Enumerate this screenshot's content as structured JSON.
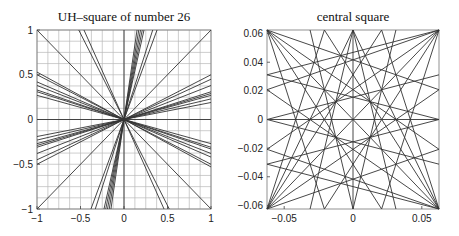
{
  "chart_data": [
    {
      "type": "line",
      "title": "UH–square of number 26",
      "xlabel": "",
      "ylabel": "",
      "xlim": [
        -1,
        1
      ],
      "ylim": [
        -1,
        1
      ],
      "grid": true,
      "grid_step": 0.125,
      "xticks": [
        -1,
        -0.5,
        0,
        0.5,
        1
      ],
      "xtick_labels": [
        "−1",
        "−0.5",
        "0",
        "0.5",
        "1"
      ],
      "yticks": [
        -1,
        -0.5,
        0,
        0.5,
        1
      ],
      "ytick_labels": [
        "−1",
        "−0.5",
        "0",
        "0.5",
        "1"
      ],
      "description": "Straight lines passing (approximately) through the origin at various slopes, clipped to the square [-1,1]x[-1,1]",
      "segments": [
        [
          [
            -1,
            1
          ],
          [
            1,
            -1
          ]
        ],
        [
          [
            -1,
            -1
          ],
          [
            1,
            1
          ]
        ],
        [
          [
            -1,
            0
          ],
          [
            1,
            0
          ]
        ],
        [
          [
            0,
            -1
          ],
          [
            0,
            1
          ]
        ],
        [
          [
            -1,
            0.53
          ],
          [
            1,
            -0.53
          ]
        ],
        [
          [
            -1,
            0.5
          ],
          [
            1,
            -0.5
          ]
        ],
        [
          [
            -1,
            0.42
          ],
          [
            1,
            -0.42
          ]
        ],
        [
          [
            -1,
            0.38
          ],
          [
            1,
            -0.38
          ]
        ],
        [
          [
            -1,
            0.33
          ],
          [
            1,
            -0.33
          ]
        ],
        [
          [
            -1,
            0.31
          ],
          [
            1,
            -0.31
          ]
        ],
        [
          [
            -1,
            0.27
          ],
          [
            1,
            -0.27
          ]
        ],
        [
          [
            -1,
            -0.19
          ],
          [
            1,
            0.19
          ]
        ],
        [
          [
            -1,
            -0.23
          ],
          [
            1,
            0.23
          ]
        ],
        [
          [
            -1,
            -0.27
          ],
          [
            1,
            0.27
          ]
        ],
        [
          [
            -1,
            -0.29
          ],
          [
            1,
            0.29
          ]
        ],
        [
          [
            -1,
            -0.31
          ],
          [
            1,
            0.31
          ]
        ],
        [
          [
            -1,
            -0.38
          ],
          [
            1,
            0.38
          ]
        ],
        [
          [
            -1,
            -0.45
          ],
          [
            1,
            0.45
          ]
        ],
        [
          [
            -1,
            -0.5
          ],
          [
            1,
            0.5
          ]
        ],
        [
          [
            -0.52,
            1
          ],
          [
            0.52,
            -1
          ]
        ],
        [
          [
            -0.46,
            1
          ],
          [
            0.46,
            -1
          ]
        ],
        [
          [
            0.15,
            1
          ],
          [
            -0.15,
            -1
          ]
        ],
        [
          [
            0.17,
            1
          ],
          [
            -0.17,
            -1
          ]
        ],
        [
          [
            0.19,
            1
          ],
          [
            -0.19,
            -1
          ]
        ],
        [
          [
            0.21,
            1
          ],
          [
            -0.21,
            -1
          ]
        ],
        [
          [
            0.23,
            1
          ],
          [
            -0.23,
            -1
          ]
        ],
        [
          [
            0.33,
            1
          ],
          [
            -0.33,
            -1
          ]
        ],
        [
          [
            0.38,
            1
          ],
          [
            -0.38,
            -1
          ]
        ]
      ]
    },
    {
      "type": "line",
      "title": "central square",
      "xlabel": "",
      "ylabel": "",
      "xlim": [
        -0.0625,
        0.0625
      ],
      "ylim": [
        -0.0625,
        0.0625
      ],
      "grid": false,
      "xticks": [
        -0.05,
        0,
        0.05
      ],
      "xtick_labels": [
        "−0.05",
        "0",
        "0.05"
      ],
      "yticks": [
        -0.06,
        -0.04,
        -0.02,
        0,
        0.02,
        0.04,
        0.06
      ],
      "ytick_labels": [
        "−0.06",
        "−0.04",
        "−0.02",
        "0",
        "0.02",
        "0.04",
        "0.06"
      ],
      "description": "Zoom on the central square showing lines fanning from corners and edge midpoints",
      "segments": [
        [
          [
            -0.0625,
            0.0625
          ],
          [
            0.0625,
            -0.0625
          ]
        ],
        [
          [
            -0.0625,
            -0.0625
          ],
          [
            0.0625,
            0.0625
          ]
        ],
        [
          [
            -0.0625,
            0
          ],
          [
            0.0625,
            0
          ]
        ],
        [
          [
            0,
            -0.0625
          ],
          [
            0,
            0.0625
          ]
        ],
        [
          [
            -0.0625,
            0.0625
          ],
          [
            0.0625,
            0.0208
          ]
        ],
        [
          [
            -0.0625,
            0.0625
          ],
          [
            0.0625,
            -0.0208
          ]
        ],
        [
          [
            -0.0625,
            0.0625
          ],
          [
            0.0208,
            -0.0625
          ]
        ],
        [
          [
            -0.0625,
            0.0625
          ],
          [
            -0.0208,
            -0.0625
          ]
        ],
        [
          [
            0.0625,
            0.0625
          ],
          [
            -0.0625,
            0.0208
          ]
        ],
        [
          [
            0.0625,
            0.0625
          ],
          [
            -0.0625,
            -0.0208
          ]
        ],
        [
          [
            0.0625,
            0.0625
          ],
          [
            -0.0208,
            -0.0625
          ]
        ],
        [
          [
            0.0625,
            0.0625
          ],
          [
            0.0208,
            -0.0625
          ]
        ],
        [
          [
            -0.0625,
            -0.0625
          ],
          [
            0.0625,
            0.0208
          ]
        ],
        [
          [
            -0.0625,
            -0.0625
          ],
          [
            0.0625,
            -0.0208
          ]
        ],
        [
          [
            -0.0625,
            -0.0625
          ],
          [
            0.0208,
            0.0625
          ]
        ],
        [
          [
            -0.0625,
            -0.0625
          ],
          [
            -0.0208,
            0.0625
          ]
        ],
        [
          [
            0.0625,
            -0.0625
          ],
          [
            -0.0625,
            0.0208
          ]
        ],
        [
          [
            0.0625,
            -0.0625
          ],
          [
            -0.0625,
            -0.0208
          ]
        ],
        [
          [
            0.0625,
            -0.0625
          ],
          [
            -0.0208,
            0.0625
          ]
        ],
        [
          [
            0.0625,
            -0.0625
          ],
          [
            0.0208,
            0.0625
          ]
        ],
        [
          [
            0,
            0.0625
          ],
          [
            -0.0312,
            -0.0625
          ]
        ],
        [
          [
            0,
            0.0625
          ],
          [
            0.0312,
            -0.0625
          ]
        ],
        [
          [
            0,
            0.0625
          ],
          [
            -0.0625,
            -0.0625
          ]
        ],
        [
          [
            0,
            0.0625
          ],
          [
            0.0625,
            -0.0625
          ]
        ],
        [
          [
            0,
            -0.0625
          ],
          [
            -0.0312,
            0.0625
          ]
        ],
        [
          [
            0,
            -0.0625
          ],
          [
            0.0312,
            0.0625
          ]
        ],
        [
          [
            -0.0625,
            0
          ],
          [
            0.0625,
            0.0312
          ]
        ],
        [
          [
            -0.0625,
            0
          ],
          [
            0.0625,
            -0.0312
          ]
        ],
        [
          [
            0.0625,
            0
          ],
          [
            -0.0625,
            0.0312
          ]
        ],
        [
          [
            0.0625,
            0
          ],
          [
            -0.0625,
            -0.0312
          ]
        ],
        [
          [
            -0.0625,
            0.0312
          ],
          [
            0.0625,
            0.0625
          ]
        ],
        [
          [
            -0.0625,
            -0.0312
          ],
          [
            0.0625,
            -0.0625
          ]
        ]
      ]
    }
  ]
}
